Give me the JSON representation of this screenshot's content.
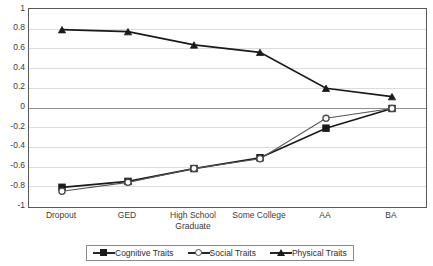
{
  "chart_data": {
    "type": "line",
    "title": "",
    "subtitle": "",
    "xlabel": "",
    "ylabel": "",
    "ylim": [
      -1,
      1
    ],
    "yticks": [
      1,
      0.8,
      0.6,
      0.4,
      0.2,
      0,
      -0.2,
      -0.4,
      -0.6,
      -0.8,
      -1
    ],
    "ytick_labels": [
      "1",
      "0.8",
      "0.6",
      "0.4",
      "0.2",
      "0",
      "-0.2",
      "-0.4",
      "-0.6",
      "-0.8",
      "-1"
    ],
    "grid": true,
    "zero_line": true,
    "legend_position": "bottom",
    "categories": [
      "Dropout",
      "GED",
      "High School\nGraduate",
      "Some College",
      "AA",
      "BA"
    ],
    "series": [
      {
        "name": "Cognitive Traits",
        "marker": "filled-square",
        "color": "#1a1a1a",
        "values": [
          -0.81,
          -0.75,
          -0.62,
          -0.51,
          -0.21,
          -0.01
        ]
      },
      {
        "name": "Social Traits",
        "marker": "open-circle",
        "color": "#555555",
        "values": [
          -0.85,
          -0.76,
          -0.62,
          -0.52,
          -0.11,
          -0.01
        ]
      },
      {
        "name": "Physical Traits",
        "marker": "filled-triangle",
        "color": "#1a1a1a",
        "values": [
          0.79,
          0.77,
          0.635,
          0.56,
          0.195,
          0.11
        ]
      }
    ]
  },
  "legend": {
    "items": [
      {
        "label": "Cognitive Traits",
        "marker": "filled-square"
      },
      {
        "label": "Social Traits",
        "marker": "open-circle"
      },
      {
        "label": "Physical Traits",
        "marker": "filled-triangle"
      }
    ]
  },
  "colors": {
    "axis": "#595959",
    "grid": "#dcdcdc",
    "zero": "#8f8f8f",
    "text": "#3b3b3b",
    "series_dark": "#1a1a1a",
    "series_gray": "#555555",
    "background": "#ffffff"
  }
}
